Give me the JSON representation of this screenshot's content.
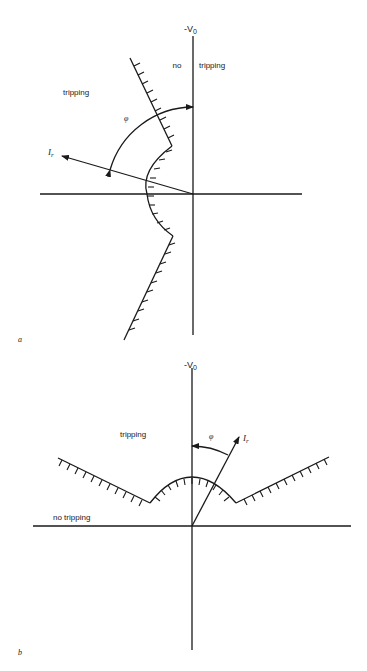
{
  "diagram_a": {
    "panel_label": "a",
    "axis_label": "-V",
    "axis_label_sub": "0",
    "region_labels": {
      "left": "tripping",
      "no": "no",
      "right": "tripping"
    },
    "current_label": "I",
    "current_label_sub": "r",
    "angle_label": "φ"
  },
  "diagram_b": {
    "panel_label": "b",
    "axis_label": "-V",
    "axis_label_sub": "0",
    "region_labels": {
      "upper": "tripping",
      "lower": "no tripping"
    },
    "current_label": "I",
    "current_label_sub": "r",
    "angle_label": "φ"
  },
  "colors": {
    "ink": "#1a1a1a",
    "background": "#ffffff"
  }
}
